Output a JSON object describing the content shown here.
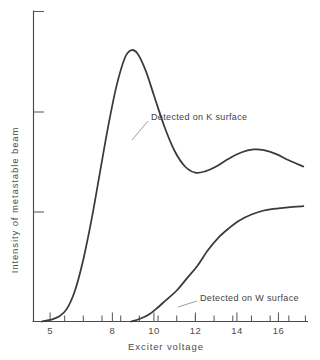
{
  "chart_data": {
    "type": "line",
    "title": "",
    "xlabel": "Exciter voltage",
    "ylabel": "Intensity of metastable beam",
    "xlim": [
      4.2,
      17.4
    ],
    "ylim": [
      0,
      1.0
    ],
    "grid": false,
    "legend_position": "inline-annotations",
    "x_tick_labels": [
      "5",
      "8",
      "10",
      "12",
      "14",
      "16"
    ],
    "x_tick_values": [
      5,
      8,
      10,
      12,
      14,
      16
    ],
    "x_minor_ticks": [
      5.7,
      6.6,
      7.5,
      8.4,
      9.3,
      10.2,
      11.1,
      12.0,
      12.9,
      13.8,
      14.7,
      15.6,
      16.5,
      17.3
    ],
    "y_tick_labels": [
      "",
      "",
      ""
    ],
    "y_tick_values": [
      0.36,
      0.68,
      1.0
    ],
    "series": [
      {
        "name": "Detected on K surface",
        "annotation": "Detected on K surface",
        "points": [
          {
            "x": 4.6,
            "y": 0.0
          },
          {
            "x": 5.0,
            "y": 0.005
          },
          {
            "x": 5.4,
            "y": 0.015
          },
          {
            "x": 5.8,
            "y": 0.04
          },
          {
            "x": 6.2,
            "y": 0.1
          },
          {
            "x": 6.6,
            "y": 0.2
          },
          {
            "x": 7.0,
            "y": 0.33
          },
          {
            "x": 7.4,
            "y": 0.48
          },
          {
            "x": 7.8,
            "y": 0.63
          },
          {
            "x": 8.2,
            "y": 0.76
          },
          {
            "x": 8.6,
            "y": 0.85
          },
          {
            "x": 8.9,
            "y": 0.875
          },
          {
            "x": 9.2,
            "y": 0.865
          },
          {
            "x": 9.6,
            "y": 0.81
          },
          {
            "x": 10.0,
            "y": 0.73
          },
          {
            "x": 10.5,
            "y": 0.63
          },
          {
            "x": 11.0,
            "y": 0.55
          },
          {
            "x": 11.5,
            "y": 0.5
          },
          {
            "x": 12.0,
            "y": 0.48
          },
          {
            "x": 12.5,
            "y": 0.485
          },
          {
            "x": 13.0,
            "y": 0.5
          },
          {
            "x": 13.6,
            "y": 0.525
          },
          {
            "x": 14.2,
            "y": 0.545
          },
          {
            "x": 14.8,
            "y": 0.555
          },
          {
            "x": 15.3,
            "y": 0.553
          },
          {
            "x": 15.9,
            "y": 0.54
          },
          {
            "x": 16.5,
            "y": 0.52
          },
          {
            "x": 17.2,
            "y": 0.5
          }
        ]
      },
      {
        "name": "Detected on W surface",
        "annotation": "Detected on W surface",
        "points": [
          {
            "x": 8.9,
            "y": 0.0
          },
          {
            "x": 9.3,
            "y": 0.008
          },
          {
            "x": 9.7,
            "y": 0.02
          },
          {
            "x": 10.1,
            "y": 0.04
          },
          {
            "x": 10.6,
            "y": 0.07
          },
          {
            "x": 11.1,
            "y": 0.1
          },
          {
            "x": 11.6,
            "y": 0.14
          },
          {
            "x": 12.1,
            "y": 0.18
          },
          {
            "x": 12.6,
            "y": 0.23
          },
          {
            "x": 13.1,
            "y": 0.27
          },
          {
            "x": 13.6,
            "y": 0.3
          },
          {
            "x": 14.1,
            "y": 0.325
          },
          {
            "x": 14.7,
            "y": 0.345
          },
          {
            "x": 15.3,
            "y": 0.358
          },
          {
            "x": 16.0,
            "y": 0.365
          },
          {
            "x": 16.7,
            "y": 0.37
          },
          {
            "x": 17.2,
            "y": 0.372
          }
        ]
      }
    ],
    "annotations": [
      {
        "label": "Detected on K surface",
        "text_x": 151,
        "text_y": 117,
        "leader": [
          [
            148,
            121
          ],
          [
            132,
            140
          ]
        ]
      },
      {
        "label": "Detected on W surface",
        "text_x": 200,
        "text_y": 298,
        "leader": [
          [
            197,
            301
          ],
          [
            178,
            307
          ]
        ]
      }
    ]
  },
  "axes": {
    "x_title": "Exciter voltage",
    "y_title": "Intensity of metastable beam"
  }
}
